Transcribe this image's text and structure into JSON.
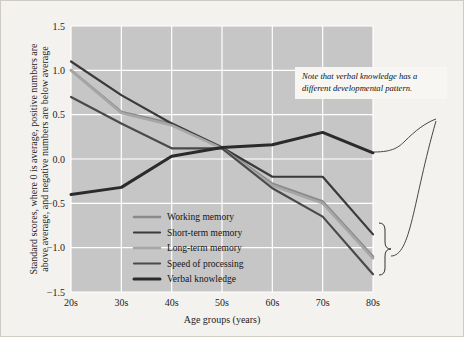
{
  "chart_data": {
    "type": "line",
    "title": "",
    "xlabel": "Age groups (years)",
    "ylabel": "Standard scores, where 0 is average, positive numbers are above average, and negative numbers are below average",
    "categories": [
      "20s",
      "30s",
      "40s",
      "50s",
      "60s",
      "70s",
      "80s"
    ],
    "ylim": [
      -1.5,
      1.5
    ],
    "yticks": [
      "1.5",
      "1.0",
      "0.5",
      "0.0",
      "-0.5",
      "-1.0",
      "-1.5"
    ],
    "ytick_values": [
      1.5,
      1.0,
      0.5,
      0.0,
      -0.5,
      -1.0,
      -1.5
    ],
    "grid": true,
    "legend_position": "inside-lower-left",
    "plot_background": "#c6c6c6",
    "gridline_color": "#ffffff",
    "series": [
      {
        "name": "Working memory",
        "color": "#8a8a8a",
        "width": 2.6,
        "values": [
          1.0,
          0.53,
          0.4,
          0.13,
          -0.28,
          -0.48,
          -1.1
        ]
      },
      {
        "name": "Short-term memory",
        "color": "#3a3a3a",
        "width": 2.2,
        "values": [
          1.1,
          0.72,
          0.4,
          0.13,
          -0.2,
          -0.2,
          -0.85
        ]
      },
      {
        "name": "Long-term memory",
        "color": "#a6a6a6",
        "width": 2.6,
        "values": [
          1.0,
          0.52,
          0.38,
          0.12,
          -0.3,
          -0.5,
          -1.12
        ]
      },
      {
        "name": "Speed of processing",
        "color": "#4a4a4a",
        "width": 2.2,
        "values": [
          0.7,
          0.4,
          0.12,
          0.12,
          -0.33,
          -0.65,
          -1.3
        ]
      },
      {
        "name": "Verbal knowledge",
        "color": "#2b2b2b",
        "width": 3.0,
        "values": [
          -0.4,
          -0.32,
          0.03,
          0.13,
          0.16,
          0.3,
          0.07
        ]
      }
    ],
    "annotations": [
      {
        "text_line1": "Note that verbal knowledge has a",
        "text_line2": "different developmental pattern.",
        "target": "Verbal knowledge"
      }
    ],
    "brace": {
      "label": "",
      "covers": [
        "Working memory",
        "Short-term memory",
        "Long-term memory",
        "Speed of processing"
      ]
    }
  }
}
